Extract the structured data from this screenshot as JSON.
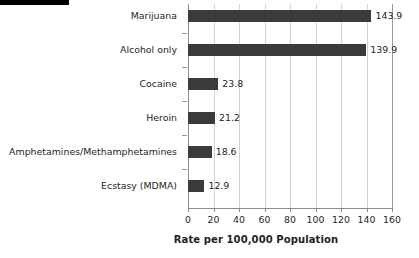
{
  "chart_data": {
    "type": "bar",
    "orientation": "horizontal",
    "title": "",
    "xlabel": "Rate per 100,000 Population",
    "ylabel": "",
    "categories": [
      "Marijuana",
      "Alcohol only",
      "Cocaine",
      "Heroin",
      "Amphetamines/Methamphetamines",
      "Ecstasy (MDMA)"
    ],
    "values": [
      143.9,
      139.9,
      23.8,
      21.2,
      18.6,
      12.9
    ],
    "value_labels": [
      "143.9",
      "139.9",
      "23.8",
      "21.2",
      "18.6",
      "12.9"
    ],
    "xlim": [
      0,
      160
    ],
    "xticks": [
      0,
      20,
      40,
      60,
      80,
      100,
      120,
      140,
      160
    ],
    "xticklabels": [
      "0",
      "20",
      "40",
      "60",
      "80",
      "100",
      "120",
      "140",
      "160"
    ],
    "grid": true,
    "legend": null,
    "bar_color": "#3b3b3b",
    "grid_color": "#d2d2d2",
    "axis_color": "#8c8c8c",
    "text_color": "#231f20"
  }
}
